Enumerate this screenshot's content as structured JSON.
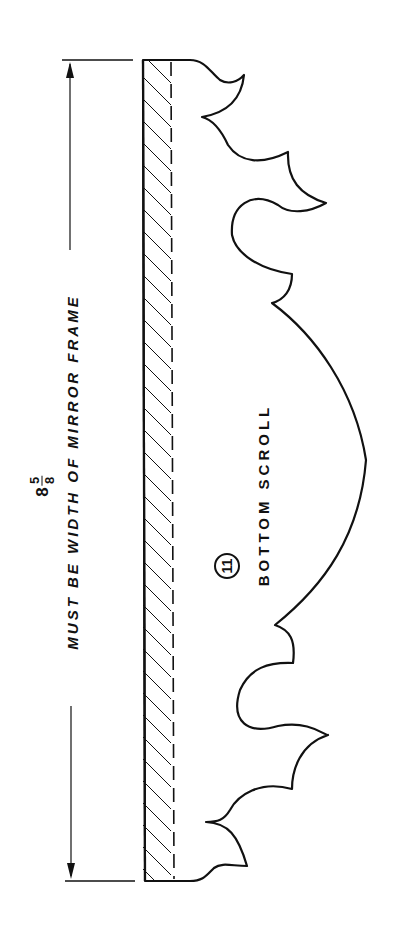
{
  "drawing": {
    "part_number": "11",
    "part_name": "BOTTOM SCROLL",
    "dimension": {
      "whole": "8",
      "numerator": "5",
      "denominator": "8",
      "note": "MUST BE WIDTH OF MIRROR FRAME"
    },
    "colors": {
      "line": "#111111",
      "background": "#ffffff"
    }
  }
}
